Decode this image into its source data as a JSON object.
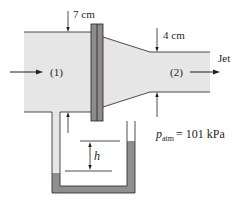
{
  "diagram": {
    "labels": {
      "inlet_diameter": "7 cm",
      "outlet_diameter": "4 cm",
      "section1": "(1)",
      "section2": "(2)",
      "jet": "Jet",
      "manometer_height": "h",
      "p_symbol": "p",
      "p_subscript": "atm",
      "p_value": "= 101 kPa"
    },
    "colors": {
      "fluid": "#e6e6e6",
      "flange": "#8c8c8c",
      "manometer_fluid": "#8f8f8f",
      "line": "#231f20"
    }
  }
}
